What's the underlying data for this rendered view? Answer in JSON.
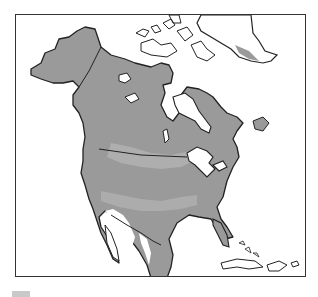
{
  "map": {
    "region": "North America",
    "colors": {
      "background": "#ffffff",
      "land_base": "#9a9a9a",
      "land_light": "#b3b3b3",
      "water_and_unshaded": "#ffffff",
      "outline": "#222222",
      "frame": "#333333"
    },
    "features": [
      "Alaska",
      "Canada",
      "Greenland",
      "Hudson Bay",
      "Great Lakes",
      "United States",
      "Mexico",
      "Florida",
      "Cuba",
      "Caribbean islands",
      "Baja California"
    ],
    "borders": [
      "Alaska-Canada border",
      "Canada-US border (49th parallel)"
    ]
  },
  "legend": {
    "swatch_color": "#c9c9c9"
  }
}
